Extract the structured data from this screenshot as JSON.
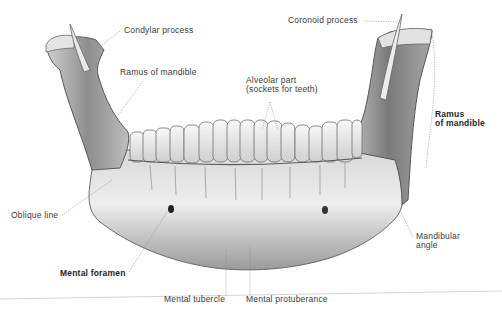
{
  "figure": {
    "labels": {
      "condylar_process": "Condylar process",
      "coronoid_process": "Coronoid process",
      "ramus_left": "Ramus of mandible",
      "alveolar_line1": "Alveolar part",
      "alveolar_line2": "(sockets for teeth)",
      "ramus_right_line1": "Ramus",
      "ramus_right_line2": "of mandible",
      "oblique_line": "Oblique line",
      "mandibular_angle_line1": "Mandibular",
      "mandibular_angle_line2": "angle",
      "mental_foramen": "Mental foramen",
      "mental_tubercle": "Mental tubercle",
      "mental_protuberance": "Mental protuberance"
    },
    "colors": {
      "background": "#ffffff",
      "bone_light": "#ececec",
      "bone_mid": "#b9b9b9",
      "bone_dark": "#6a6a6a",
      "leader_line": "#8a8a8a",
      "text": "#3a3a3a"
    }
  }
}
